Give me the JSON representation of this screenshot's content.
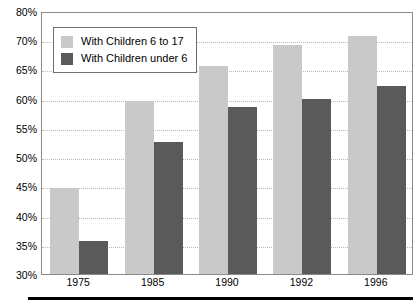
{
  "chart_data": {
    "type": "bar",
    "title": "",
    "subtitle": "",
    "xlabel": "",
    "ylabel": "",
    "categories": [
      "1975",
      "1985",
      "1990",
      "1992",
      "1996"
    ],
    "series": [
      {
        "name": "With Children 6 to 17",
        "color": "#c9c9c9",
        "values": [
          45,
          60,
          66,
          69.5,
          72
        ]
      },
      {
        "name": "With Children under 6",
        "color": "#5a5a5a",
        "values": [
          36,
          53,
          59,
          60.2,
          62.5
        ]
      }
    ],
    "ytick_labels": [
      "80%",
      "70%",
      "65%",
      "60%",
      "55%",
      "50%",
      "45%",
      "40%",
      "35%",
      "30%"
    ],
    "ytick_values": [
      80,
      70,
      65,
      60,
      55,
      50,
      45,
      40,
      35,
      30
    ],
    "ylim": [
      30,
      80
    ],
    "grid": true,
    "grid_axis": "y",
    "legend_position": "upper left",
    "value_suffix": "%",
    "note": "Y axis is irregular: equal pixel spacing between each labeled tick, so the 70-80 band is compressed."
  },
  "legend": {
    "entries": [
      {
        "label": "With Children 6 to 17"
      },
      {
        "label": "With Children under 6"
      }
    ]
  }
}
